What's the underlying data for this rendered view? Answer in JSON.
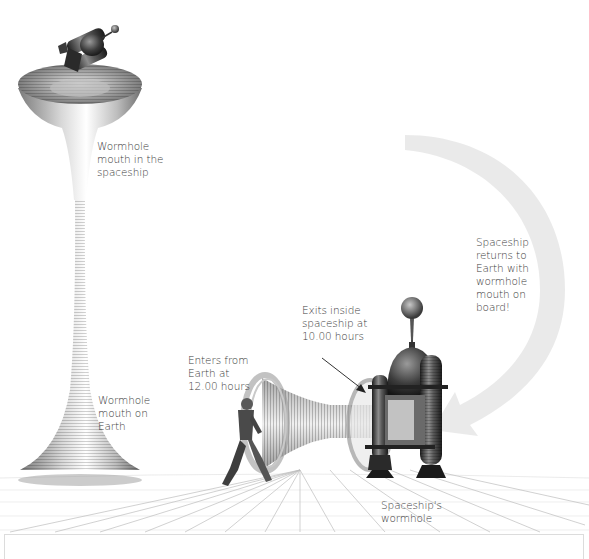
{
  "diagram": {
    "type": "illustration",
    "labels": {
      "mouth_spaceship": "Wormhole\nmouth in the\nspaceship",
      "mouth_earth": "Wormhole\nmouth on\nEarth",
      "enters": "Enters from\nEarth  at\n12.00 hours",
      "exits": "Exits inside\nspaceship at\n10.00 hours",
      "returns": "Spaceship\nreturns to\nEarth with\nwormhole\nmouth on\nboard!",
      "spaceship_wormhole": "Spaceship's\nwormhole"
    },
    "nodes": [
      {
        "id": "tall-wormhole",
        "desc": "Tall funnel-shaped wormhole rising from Earth"
      },
      {
        "id": "small-spaceship",
        "desc": "Spaceship at top of tall wormhole"
      },
      {
        "id": "astronaut",
        "desc": "Figure walking into wormhole"
      },
      {
        "id": "horizontal-wormhole",
        "desc": "Horizontal wormhole tunnel into spaceship"
      },
      {
        "id": "landed-spaceship",
        "desc": "Domed spaceship on Earth's surface"
      },
      {
        "id": "return-arrow",
        "desc": "Large curved grey arrow from top to landed spaceship"
      }
    ],
    "colors": {
      "text": "#3c3c3c",
      "arrow": "#e6e6e6",
      "grid": "#b8b8b8",
      "metal_dark": "#2e2e2e",
      "metal_mid": "#8a8a8a"
    }
  }
}
